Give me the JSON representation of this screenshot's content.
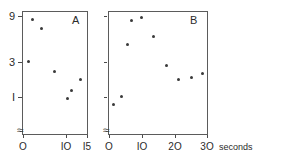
{
  "chart_data": [
    {
      "type": "scatter",
      "panel": "A",
      "title": "",
      "xlabel": "",
      "ylabel": "",
      "xlim": [
        0,
        15
      ],
      "ylim": [
        0.8,
        10
      ],
      "yscale": "log",
      "y_axis_break": true,
      "grid": false,
      "legend": null,
      "xticks": [
        0,
        10,
        15
      ],
      "xticklabels": [
        "O",
        "IO",
        "I5"
      ],
      "yticks": [
        1,
        3,
        9
      ],
      "yticklabels": [
        "I",
        "3",
        "9"
      ],
      "points": [
        {
          "x": 2.3,
          "y": 8.2
        },
        {
          "x": 4.2,
          "y": 6.4
        },
        {
          "x": 1.2,
          "y": 2.6
        },
        {
          "x": 7.4,
          "y": 2.0
        },
        {
          "x": 13.4,
          "y": 1.62
        },
        {
          "x": 11.2,
          "y": 1.18
        },
        {
          "x": 10.4,
          "y": 0.97
        }
      ]
    },
    {
      "type": "scatter",
      "panel": "B",
      "title": "",
      "xlabel": "30 seconds",
      "ylabel": "",
      "xlim": [
        0,
        30
      ],
      "ylim": [
        0.8,
        10
      ],
      "yscale": "log",
      "y_axis_break": true,
      "grid": false,
      "legend": null,
      "xticks": [
        0,
        10,
        20,
        30
      ],
      "xticklabels": [
        "O",
        "IO",
        "2O",
        "3O"
      ],
      "yticks": [
        1,
        3,
        9
      ],
      "yticklabels": [
        "",
        "",
        ""
      ],
      "points": [
        {
          "x": 6.9,
          "y": 7.9
        },
        {
          "x": 9.8,
          "y": 8.6
        },
        {
          "x": 5.6,
          "y": 4.2
        },
        {
          "x": 13.4,
          "y": 5.2
        },
        {
          "x": 17.5,
          "y": 2.35
        },
        {
          "x": 21.0,
          "y": 1.62
        },
        {
          "x": 25.0,
          "y": 1.72
        },
        {
          "x": 28.6,
          "y": 1.9
        },
        {
          "x": 3.8,
          "y": 1.02
        },
        {
          "x": 1.2,
          "y": 0.82
        }
      ]
    }
  ],
  "panels": {
    "a": {
      "letter": "A",
      "x_tick_labels": [
        "O",
        "IO",
        "I5"
      ],
      "y_tick_labels": [
        "9",
        "3",
        "I"
      ],
      "break_glyph": "≈"
    },
    "b": {
      "letter": "B",
      "x_tick_labels": [
        "O",
        "IO",
        "2O",
        "3O"
      ],
      "x_axis_caption": "seconds",
      "break_glyph": "≈"
    }
  }
}
